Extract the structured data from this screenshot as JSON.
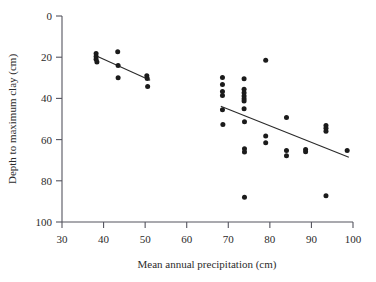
{
  "figure": {
    "name": "scatter-plot-depth-vs-precipitation",
    "background": "#ffffff",
    "point_color": "#1b1b1b",
    "line_color": "#2a2a2a",
    "axis_color": "#55555f"
  },
  "chart_data": {
    "type": "scatter",
    "title": "",
    "xlabel": "Mean annual precipitation (cm)",
    "ylabel": "Depth to maximum clay (cm)",
    "xlim": [
      30,
      100
    ],
    "ylim": [
      0,
      100
    ],
    "y_inverted": true,
    "grid": false,
    "legend": "none",
    "xticks": [
      30,
      40,
      50,
      60,
      70,
      80,
      90,
      100
    ],
    "xticklabels": [
      "30",
      "40",
      "50",
      "60",
      "70",
      "80",
      "90",
      "100"
    ],
    "yticks": [
      0,
      20,
      40,
      60,
      80,
      100
    ],
    "yticklabels": [
      "0",
      "20",
      "40",
      "60",
      "80",
      "100"
    ],
    "series": [
      {
        "name": "low-precipitation-group",
        "points": [
          {
            "x": 38.2,
            "y": 18.2
          },
          {
            "x": 38.2,
            "y": 19.6
          },
          {
            "x": 38.2,
            "y": 21.0
          },
          {
            "x": 38.4,
            "y": 22.3
          },
          {
            "x": 43.4,
            "y": 17.3
          },
          {
            "x": 43.5,
            "y": 24.0
          },
          {
            "x": 43.5,
            "y": 30.0
          },
          {
            "x": 50.4,
            "y": 29.0
          },
          {
            "x": 50.5,
            "y": 30.3
          },
          {
            "x": 50.6,
            "y": 34.2
          }
        ]
      },
      {
        "name": "high-precipitation-group",
        "points": [
          {
            "x": 68.6,
            "y": 29.8
          },
          {
            "x": 68.6,
            "y": 33.2
          },
          {
            "x": 68.6,
            "y": 36.6
          },
          {
            "x": 68.6,
            "y": 38.6
          },
          {
            "x": 68.6,
            "y": 45.5
          },
          {
            "x": 68.7,
            "y": 52.7
          },
          {
            "x": 73.8,
            "y": 30.5
          },
          {
            "x": 73.8,
            "y": 35.5
          },
          {
            "x": 73.8,
            "y": 37.3
          },
          {
            "x": 73.8,
            "y": 38.8
          },
          {
            "x": 73.8,
            "y": 40.2
          },
          {
            "x": 73.8,
            "y": 41.3
          },
          {
            "x": 73.8,
            "y": 45.0
          },
          {
            "x": 73.9,
            "y": 51.3
          },
          {
            "x": 73.9,
            "y": 64.5
          },
          {
            "x": 73.9,
            "y": 66.0
          },
          {
            "x": 73.9,
            "y": 88.0
          },
          {
            "x": 79.0,
            "y": 21.5
          },
          {
            "x": 79.0,
            "y": 58.3
          },
          {
            "x": 79.0,
            "y": 61.5
          },
          {
            "x": 84.0,
            "y": 49.3
          },
          {
            "x": 84.0,
            "y": 65.3
          },
          {
            "x": 84.0,
            "y": 67.8
          },
          {
            "x": 88.6,
            "y": 64.8
          },
          {
            "x": 88.6,
            "y": 65.9
          },
          {
            "x": 93.5,
            "y": 53.2
          },
          {
            "x": 93.5,
            "y": 54.5
          },
          {
            "x": 93.5,
            "y": 55.9
          },
          {
            "x": 93.5,
            "y": 87.3
          },
          {
            "x": 98.6,
            "y": 65.3
          }
        ]
      }
    ],
    "fit_lines": [
      {
        "name": "low-group-regression",
        "x0": 38.3,
        "y0": 19.4,
        "x1": 51.2,
        "y1": 31.2
      },
      {
        "name": "high-group-regression",
        "x0": 68.2,
        "y0": 43.8,
        "x1": 99.0,
        "y1": 68.6
      }
    ]
  }
}
